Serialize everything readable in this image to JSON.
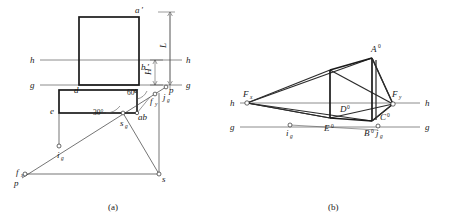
{
  "figure": {
    "panels": [
      {
        "key": "a",
        "caption": "(a)"
      },
      {
        "key": "b",
        "caption": "(b)"
      }
    ]
  },
  "panel_a": {
    "caption": "(a)",
    "reference_lines": [
      {
        "name": "horizon-line",
        "label_left": "h",
        "label_right": "h"
      },
      {
        "name": "ground-line",
        "label_left": "g",
        "label_right": "g"
      }
    ],
    "dimensions": [
      {
        "name": "height-L",
        "label": "L"
      },
      {
        "name": "height-H",
        "label": "H"
      }
    ],
    "angles": [
      {
        "name": "angle-60",
        "label": "60°"
      },
      {
        "name": "angle-30",
        "label": "30°"
      }
    ],
    "points": [
      {
        "id": "a-prime",
        "label": "a",
        "prime": "′"
      },
      {
        "id": "b-prime",
        "label": "b",
        "prime": "′"
      },
      {
        "id": "c",
        "label": "c"
      },
      {
        "id": "d",
        "label": "d"
      },
      {
        "id": "e",
        "label": "e"
      },
      {
        "id": "ab",
        "label": "ab"
      },
      {
        "id": "p-upper",
        "label": "p"
      },
      {
        "id": "p-lower",
        "label": "p"
      },
      {
        "id": "s",
        "label": "s"
      },
      {
        "id": "s-g",
        "label": "s",
        "sub": "g"
      },
      {
        "id": "i-g",
        "label": "i",
        "sub": "g"
      },
      {
        "id": "j-g",
        "label": "j",
        "sub": "g"
      },
      {
        "id": "f-x",
        "label": "f",
        "sub": "x"
      },
      {
        "id": "f-y",
        "label": "f",
        "sub": "y"
      }
    ]
  },
  "panel_b": {
    "caption": "(b)",
    "reference_lines": [
      {
        "name": "horizon-line",
        "label_left": "h",
        "label_right": "h"
      },
      {
        "name": "ground-line",
        "label_left": "g",
        "label_right": "g"
      }
    ],
    "points": [
      {
        "id": "A0",
        "label": "A",
        "sup": "0"
      },
      {
        "id": "B0",
        "label": "B",
        "sup": "0"
      },
      {
        "id": "C0",
        "label": "C",
        "sup": "0"
      },
      {
        "id": "D0",
        "label": "D",
        "sup": "0"
      },
      {
        "id": "E0",
        "label": "E",
        "sup": "0"
      },
      {
        "id": "F-x",
        "label": "F",
        "sub": "x"
      },
      {
        "id": "F-y",
        "label": "F",
        "sub": "y"
      },
      {
        "id": "i-g",
        "label": "i",
        "sub": "g"
      },
      {
        "id": "j-g",
        "label": "j",
        "sub": "g"
      }
    ]
  },
  "colors": {
    "ink": "#1a1a1a",
    "line": "#3a3a3a",
    "reference": "#6e6e6e",
    "background": "#ffffff"
  }
}
